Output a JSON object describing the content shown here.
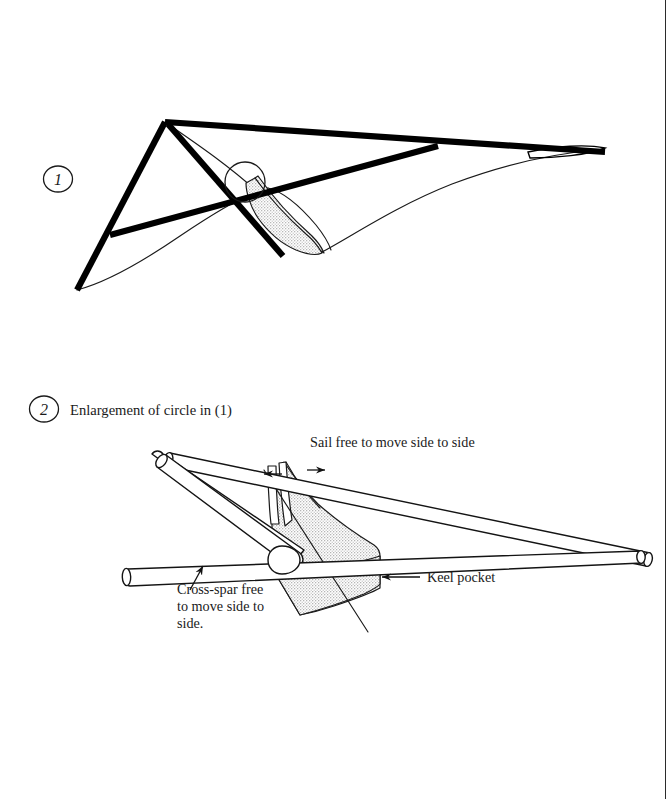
{
  "document": {
    "type": "instructional-diagram",
    "subject": "Kite sail and cross-spar assembly",
    "background_color": "#ffffff",
    "ink_color": "#1a1a1a",
    "shading_color": "#dedede"
  },
  "figures": [
    {
      "id": "figure-1",
      "step_number": "1",
      "caption": "",
      "callout": {
        "name": "detail-circle",
        "cx": 245,
        "cy": 182,
        "r": 20
      }
    },
    {
      "id": "figure-2",
      "step_number": "2",
      "caption": "Enlargement of circle in (1)"
    }
  ],
  "labels": {
    "sail_free": "Sail free to move side to side",
    "cross_spar": [
      "Cross-spar free",
      "to move side to",
      "side."
    ],
    "keel_pocket": "Keel pocket"
  },
  "icons": {
    "arrow_left": "arrow-left-icon",
    "arrow_right": "arrow-right-icon",
    "leader_arrow": "leader-arrow-icon"
  }
}
